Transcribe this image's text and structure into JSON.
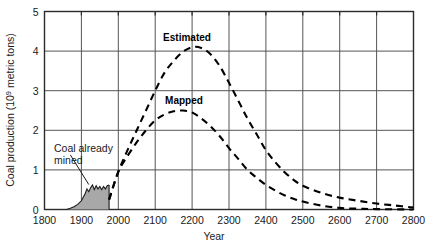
{
  "chart_data": {
    "type": "line",
    "title": "",
    "xlabel": "Year",
    "ylabel_main": "Coal production (10",
    "ylabel_sup": "9",
    "ylabel_tail": " metric tons)",
    "ylabel_full": "Coal production (10⁹ metric tons)",
    "xlim": [
      1800,
      2800
    ],
    "ylim": [
      0,
      5
    ],
    "xticks": [
      1800,
      1900,
      2000,
      2100,
      2200,
      2300,
      2400,
      2500,
      2600,
      2700,
      2800
    ],
    "xtick_labels": [
      "1800",
      "1900",
      "2000",
      "2100",
      "2200",
      "2300",
      "2400",
      "2500",
      "2600",
      "2700",
      "2800"
    ],
    "yticks": [
      0,
      1,
      2,
      3,
      4,
      5
    ],
    "ytick_labels": [
      "0",
      "1",
      "2",
      "3",
      "4",
      "5"
    ],
    "grid": true,
    "legend_position": "inline-annotations",
    "series": [
      {
        "name": "Estimated",
        "style": "dashed",
        "color": "#000000",
        "x": [
          1975,
          2000,
          2025,
          2050,
          2075,
          2100,
          2125,
          2150,
          2175,
          2200,
          2225,
          2250,
          2275,
          2300,
          2325,
          2350,
          2375,
          2400,
          2425,
          2450,
          2475,
          2500,
          2550,
          2600,
          2650,
          2700,
          2750,
          2800
        ],
        "values": [
          0.25,
          0.95,
          1.5,
          2.0,
          2.5,
          3.0,
          3.45,
          3.75,
          3.98,
          4.1,
          4.08,
          3.92,
          3.62,
          3.2,
          2.75,
          2.3,
          1.9,
          1.5,
          1.2,
          0.95,
          0.75,
          0.6,
          0.42,
          0.3,
          0.22,
          0.15,
          0.1,
          0.05
        ]
      },
      {
        "name": "Mapped",
        "style": "dashed",
        "color": "#000000",
        "x": [
          1975,
          2000,
          2025,
          2050,
          2075,
          2100,
          2125,
          2150,
          2175,
          2200,
          2225,
          2250,
          2275,
          2300,
          2325,
          2350,
          2375,
          2400,
          2425,
          2450,
          2475,
          2500,
          2550,
          2600,
          2650,
          2700,
          2800
        ],
        "values": [
          0.25,
          0.95,
          1.35,
          1.7,
          2.0,
          2.25,
          2.4,
          2.48,
          2.5,
          2.45,
          2.3,
          2.1,
          1.85,
          1.55,
          1.28,
          1.0,
          0.8,
          0.62,
          0.48,
          0.36,
          0.27,
          0.2,
          0.1,
          0.04,
          0.02,
          0.01,
          0.0
        ]
      }
    ],
    "shaded_region": {
      "name": "Coal already mined",
      "fill": "#a8a8a8",
      "x": [
        1860,
        1870,
        1880,
        1890,
        1900,
        1910,
        1915,
        1920,
        1925,
        1930,
        1935,
        1940,
        1945,
        1950,
        1955,
        1960,
        1965,
        1970,
        1975
      ],
      "values": [
        0.0,
        0.03,
        0.07,
        0.13,
        0.22,
        0.4,
        0.52,
        0.45,
        0.55,
        0.62,
        0.5,
        0.6,
        0.52,
        0.58,
        0.5,
        0.58,
        0.52,
        0.6,
        0.62
      ]
    },
    "annotations": [
      {
        "name": "coal-already-mined",
        "text_line1": "Coal already",
        "text_line2": "mined"
      },
      {
        "name": "estimated-curve-label",
        "text": "Estimated"
      },
      {
        "name": "mapped-curve-label",
        "text": "Mapped"
      }
    ]
  },
  "labels": {
    "estimated": "Estimated",
    "mapped": "Mapped",
    "coal_mined_line1": "Coal already",
    "coal_mined_line2": "mined",
    "xaxis": "Year",
    "yaxis_prefix": "Coal production (10",
    "yaxis_exponent": "9",
    "yaxis_suffix": " metric tons)"
  },
  "ticks": {
    "x": [
      "1800",
      "1900",
      "2000",
      "2100",
      "2200",
      "2300",
      "2400",
      "2500",
      "2600",
      "2700",
      "2800"
    ],
    "y": [
      "0",
      "1",
      "2",
      "3",
      "4",
      "5"
    ]
  },
  "colors": {
    "background": "#ffffff",
    "axis": "#2b2b2b",
    "grid": "#555555",
    "curve": "#000000",
    "shade_fill": "#a8a8a8",
    "shade_stroke": "#1a1a1a"
  }
}
